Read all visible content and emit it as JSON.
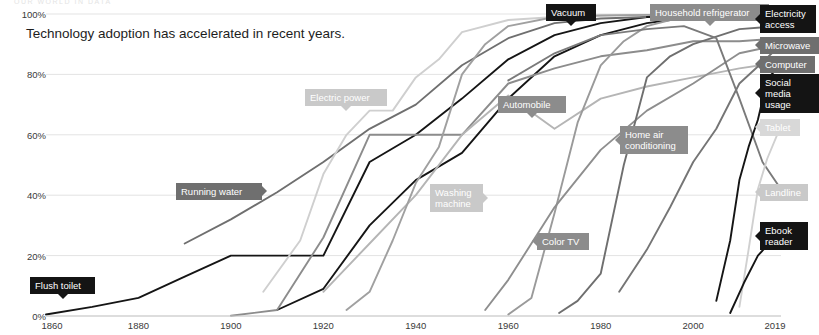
{
  "top_strip_text": "OUR WORLD IN DATA",
  "headline": "Technology adoption has accelerated in recent years.",
  "chart_data": {
    "type": "line",
    "title": "Technology adoption has accelerated in recent years.",
    "xlabel": "",
    "ylabel": "",
    "xlim": [
      1860,
      2019
    ],
    "ylim": [
      0,
      100
    ],
    "grid": true,
    "legend_position": "inline-labels-and-right-edge",
    "x_ticks": [
      "1860",
      "1880",
      "1900",
      "1920",
      "1940",
      "1960",
      "1980",
      "2000",
      "2019"
    ],
    "x_tick_values": [
      1860,
      1880,
      1900,
      1920,
      1940,
      1960,
      1980,
      2000,
      2019
    ],
    "y_ticks": [
      "0%",
      "20%",
      "40%",
      "60%",
      "80%",
      "100%"
    ],
    "y_tick_values": [
      0,
      20,
      40,
      60,
      80,
      100
    ],
    "series": [
      {
        "name": "Flush toilet",
        "color": "#151515",
        "label_style": "dark",
        "x": [
          1860,
          1870,
          1880,
          1890,
          1900,
          1910,
          1920,
          1930,
          1940,
          1950,
          1960,
          1970,
          1980,
          1990,
          2000,
          2010,
          2019
        ],
        "values": [
          0.5,
          3,
          6,
          13,
          20,
          20,
          20,
          51,
          60,
          72,
          85,
          93,
          97,
          99,
          99.5,
          99.8,
          100
        ]
      },
      {
        "name": "Running water",
        "color": "#6f6f6f",
        "label_style": "mid",
        "x": [
          1890,
          1900,
          1910,
          1920,
          1930,
          1940,
          1950,
          1960,
          1970,
          1980,
          1990,
          2000,
          2010,
          2019
        ],
        "values": [
          24,
          32,
          41,
          51,
          62,
          70,
          83,
          92,
          97,
          98.5,
          99,
          99.3,
          99.5,
          99.6
        ]
      },
      {
        "name": "Electric power",
        "color": "#cfcfcf",
        "label_style": "light",
        "x": [
          1907,
          1915,
          1920,
          1925,
          1930,
          1935,
          1940,
          1945,
          1950,
          1960,
          1970,
          1980,
          1990,
          2000,
          2010,
          2019
        ],
        "values": [
          8,
          25,
          47,
          60,
          68,
          68,
          79,
          85,
          94,
          98,
          99,
          99.5,
          99.7,
          99.8,
          99.9,
          100
        ]
      },
      {
        "name": "Vacuum",
        "color": "#151515",
        "label_style": "dark",
        "x": [
          1910,
          1920,
          1930,
          1940,
          1950,
          1960,
          1970,
          1980,
          1990,
          2000,
          2010,
          2019
        ],
        "values": [
          2,
          9,
          30,
          45,
          54,
          72,
          86,
          93,
          97,
          99,
          99.5,
          99.7
        ]
      },
      {
        "name": "Automobile",
        "color": "#8c8c8c",
        "label_style": "midlight",
        "x": [
          1900,
          1910,
          1920,
          1930,
          1940,
          1950,
          1960,
          1970,
          1980,
          1990,
          2000,
          2010,
          2019
        ],
        "values": [
          0.1,
          2,
          26,
          60,
          60,
          60,
          77,
          82,
          86,
          88,
          91,
          91,
          92
        ]
      },
      {
        "name": "Washing machine",
        "color": "#b5b5b5",
        "label_style": "light",
        "x": [
          1920,
          1930,
          1940,
          1950,
          1960,
          1970,
          1980,
          1990,
          2000,
          2010,
          2019
        ],
        "values": [
          8,
          24,
          40,
          60,
          73,
          62,
          72,
          76,
          79,
          82,
          84
        ]
      },
      {
        "name": "Household refrigerator",
        "color": "#a0a0a0",
        "label_style": "midlight",
        "x": [
          1925,
          1930,
          1935,
          1940,
          1945,
          1950,
          1955,
          1960,
          1970,
          1980,
          1990,
          2000,
          2010,
          2019
        ],
        "values": [
          2,
          8,
          25,
          44,
          56,
          80,
          90,
          96,
          99,
          99.5,
          99.7,
          99.8,
          99.9,
          100
        ]
      },
      {
        "name": "Color TV",
        "color": "#9a9a9a",
        "label_style": "midlight",
        "x": [
          1960,
          1965,
          1970,
          1975,
          1980,
          1985,
          1990,
          1995,
          2000,
          2010,
          2019
        ],
        "values": [
          0.5,
          6,
          34,
          64,
          83,
          91,
          96,
          98,
          99,
          99.5,
          99.6
        ]
      },
      {
        "name": "Home air conditioning",
        "color": "#8e8e8e",
        "label_style": "midlight",
        "x": [
          1955,
          1960,
          1970,
          1980,
          1990,
          2000,
          2010,
          2019
        ],
        "values": [
          2,
          12,
          36,
          55,
          68,
          77,
          87,
          90
        ]
      },
      {
        "name": "Microwave",
        "color": "#6f6f6f",
        "label_style": "mid",
        "x": [
          1971,
          1975,
          1980,
          1985,
          1990,
          1995,
          2000,
          2010,
          2019
        ],
        "values": [
          1,
          5,
          14,
          50,
          79,
          86,
          90,
          95,
          96
        ]
      },
      {
        "name": "Computer",
        "color": "#757575",
        "label_style": "mid",
        "x": [
          1984,
          1990,
          1995,
          2000,
          2005,
          2010,
          2015,
          2019
        ],
        "values": [
          8,
          22,
          36,
          51,
          62,
          77,
          84,
          90
        ]
      },
      {
        "name": "Electricity access",
        "color": "#151515",
        "label_style": "dark",
        "x": [
          1990,
          2000,
          2010,
          2019
        ],
        "values": [
          99,
          99.5,
          100,
          100
        ]
      },
      {
        "name": "Landline",
        "color": "#7a7a7a",
        "label_style": "light",
        "x": [
          1960,
          1970,
          1980,
          1990,
          1998,
          2005,
          2010,
          2015,
          2019
        ],
        "values": [
          78,
          87,
          93,
          95,
          96,
          92,
          72,
          51,
          42
        ]
      },
      {
        "name": "Social media usage",
        "color": "#151515",
        "label_style": "dark",
        "x": [
          2005,
          2008,
          2010,
          2012,
          2014,
          2016,
          2019
        ],
        "values": [
          5,
          25,
          45,
          56,
          65,
          78,
          84
        ]
      },
      {
        "name": "Tablet",
        "color": "#d0d0d0",
        "label_style": "xlight",
        "x": [
          2010,
          2012,
          2014,
          2016,
          2019
        ],
        "values": [
          3,
          22,
          42,
          52,
          63
        ]
      },
      {
        "name": "Ebook reader",
        "color": "#151515",
        "label_style": "dark",
        "x": [
          2008,
          2011,
          2014,
          2017,
          2019
        ],
        "values": [
          1,
          11,
          20,
          25,
          26
        ]
      }
    ]
  },
  "inline_labels": [
    {
      "text": "Running water",
      "style": "mid",
      "tip": "right",
      "x": 176,
      "y": 183,
      "w": 86,
      "h": 16
    },
    {
      "text": "Electric power",
      "style": "light",
      "tip": "bottom",
      "x": 305,
      "y": 89,
      "w": 82,
      "h": 16
    },
    {
      "text": "Vacuum",
      "style": "dark",
      "tip": "bottom",
      "x": 546,
      "y": 4,
      "w": 50,
      "h": 16
    },
    {
      "text": "Household refrigerator",
      "style": "midlight",
      "tip": "bottom",
      "x": 650,
      "y": 4,
      "w": 119,
      "h": 16
    },
    {
      "text": "Automobile",
      "style": "midlight",
      "tip": "bottom",
      "x": 498,
      "y": 96,
      "w": 68,
      "h": 16
    },
    {
      "text": "Washing\nmachine",
      "style": "light",
      "tip": "right",
      "x": 430,
      "y": 184,
      "w": 53,
      "h": 27
    },
    {
      "text": "Color TV",
      "style": "midlight",
      "tip": "left",
      "x": 537,
      "y": 233,
      "w": 52,
      "h": 16
    },
    {
      "text": "Home air\nconditioning",
      "style": "midlight",
      "tip": "left",
      "x": 620,
      "y": 126,
      "w": 68,
      "h": 27
    },
    {
      "text": "Flush toilet",
      "style": "dark",
      "tip": "bottom",
      "x": 30,
      "y": 277,
      "w": 65,
      "h": 16
    }
  ],
  "edge_labels": [
    {
      "text": "Electricity\naccess",
      "style": "dark",
      "x": 760,
      "y": 5,
      "w": 56,
      "h": 28
    },
    {
      "text": "Microwave",
      "style": "mid",
      "x": 760,
      "y": 37,
      "w": 59,
      "h": 16
    },
    {
      "text": "Computer",
      "style": "mid",
      "x": 760,
      "y": 56,
      "w": 55,
      "h": 16
    },
    {
      "text": "Social media\nusage",
      "style": "dark",
      "x": 760,
      "y": 74,
      "w": 59,
      "h": 28
    },
    {
      "text": "Tablet",
      "style": "xlight",
      "x": 760,
      "y": 119,
      "w": 40,
      "h": 16
    },
    {
      "text": "Landline",
      "style": "light",
      "x": 760,
      "y": 184,
      "w": 48,
      "h": 16
    },
    {
      "text": "Ebook\nreader",
      "style": "dark",
      "x": 760,
      "y": 222,
      "w": 48,
      "h": 28
    }
  ],
  "colors": {
    "background": "#ffffff",
    "gridline": "#e3e3e3",
    "axis_text": "#3a3a3a",
    "headline_text": "#1d1d1d"
  }
}
